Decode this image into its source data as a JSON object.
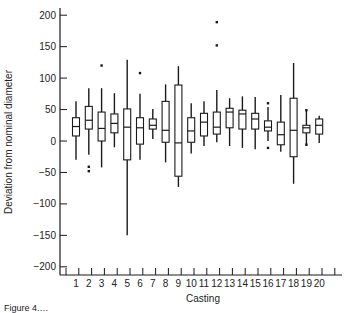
{
  "chart_data": {
    "type": "boxplot",
    "title": "",
    "xlabel": "Casting",
    "ylabel": "Deviation from nominal diameter",
    "ylim": [
      -215,
      215
    ],
    "yticks": [
      200,
      150,
      100,
      50,
      0,
      -50,
      -100,
      -150,
      -200
    ],
    "ytick_labels": [
      "200",
      "150",
      "100",
      "50",
      "0",
      "−50",
      "−100",
      "−150",
      "−200"
    ],
    "categories": [
      "1",
      "2",
      "3",
      "4",
      "5",
      "6",
      "7",
      "8",
      "9",
      "10",
      "11",
      "12",
      "13",
      "14",
      "15",
      "16",
      "17",
      "18",
      "19",
      "20"
    ],
    "grid": false,
    "boxes": [
      {
        "cat": "1",
        "whislo": -30,
        "q1": 8,
        "med": 23,
        "q3": 37,
        "whishi": 63,
        "fliers": []
      },
      {
        "cat": "2",
        "whislo": -22,
        "q1": 19,
        "med": 33,
        "q3": 55,
        "whishi": 84,
        "fliers": [
          -41,
          -48
        ]
      },
      {
        "cat": "3",
        "whislo": -42,
        "q1": 0,
        "med": 20,
        "q3": 46,
        "whishi": 84,
        "fliers": [
          120
        ]
      },
      {
        "cat": "4",
        "whislo": -10,
        "q1": 13,
        "med": 28,
        "q3": 43,
        "whishi": 76,
        "fliers": []
      },
      {
        "cat": "5",
        "whislo": -150,
        "q1": -30,
        "med": 22,
        "q3": 51,
        "whishi": 129,
        "fliers": []
      },
      {
        "cat": "6",
        "whislo": -30,
        "q1": -5,
        "med": 21,
        "q3": 37,
        "whishi": 75,
        "fliers": [
          108
        ]
      },
      {
        "cat": "7",
        "whislo": 3,
        "q1": 19,
        "med": 25,
        "q3": 35,
        "whishi": 51,
        "fliers": []
      },
      {
        "cat": "8",
        "whislo": -34,
        "q1": -2,
        "med": 17,
        "q3": 63,
        "whishi": 90,
        "fliers": []
      },
      {
        "cat": "9",
        "whislo": -73,
        "q1": -56,
        "med": -3,
        "q3": 89,
        "whishi": 119,
        "fliers": []
      },
      {
        "cat": "10",
        "whislo": -20,
        "q1": -2,
        "med": 16,
        "q3": 37,
        "whishi": 60,
        "fliers": []
      },
      {
        "cat": "11",
        "whislo": -8,
        "q1": 8,
        "med": 30,
        "q3": 44,
        "whishi": 63,
        "fliers": []
      },
      {
        "cat": "12",
        "whislo": -2,
        "q1": 11,
        "med": 22,
        "q3": 46,
        "whishi": 81,
        "fliers": [
          152,
          189
        ]
      },
      {
        "cat": "13",
        "whislo": -8,
        "q1": 21,
        "med": 46,
        "q3": 52,
        "whishi": 68,
        "fliers": []
      },
      {
        "cat": "14",
        "whislo": -11,
        "q1": 19,
        "med": 43,
        "q3": 49,
        "whishi": 71,
        "fliers": []
      },
      {
        "cat": "15",
        "whislo": -13,
        "q1": 19,
        "med": 35,
        "q3": 44,
        "whishi": 70,
        "fliers": []
      },
      {
        "cat": "16",
        "whislo": 0,
        "q1": 16,
        "med": 22,
        "q3": 32,
        "whishi": 54,
        "fliers": [
          60,
          -11
        ]
      },
      {
        "cat": "17",
        "whislo": -17,
        "q1": -6,
        "med": 10,
        "q3": 30,
        "whishi": 73,
        "fliers": []
      },
      {
        "cat": "18",
        "whislo": -68,
        "q1": -25,
        "med": 17,
        "q3": 68,
        "whishi": 124,
        "fliers": []
      },
      {
        "cat": "19",
        "whislo": -6,
        "q1": 13,
        "med": 21,
        "q3": 25,
        "whishi": 49,
        "fliers": [
          49,
          -6
        ]
      },
      {
        "cat": "20",
        "whislo": -3,
        "q1": 11,
        "med": 25,
        "q3": 35,
        "whishi": 40,
        "fliers": []
      }
    ],
    "legend": null
  },
  "caption": "Figure 4.…"
}
